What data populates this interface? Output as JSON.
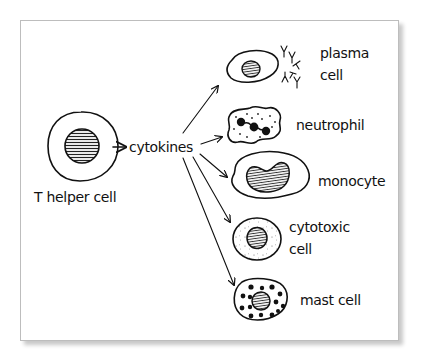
{
  "diagram": {
    "source": {
      "label": "T helper cell"
    },
    "mediator": {
      "label": "cytokines"
    },
    "targets": [
      {
        "label_line1": "plasma",
        "label_line2": "cell"
      },
      {
        "label_line1": "neutrophil",
        "label_line2": ""
      },
      {
        "label_line1": "monocyte",
        "label_line2": ""
      },
      {
        "label_line1": "cytotoxic",
        "label_line2": "cell"
      },
      {
        "label_line1": "mast cell",
        "label_line2": ""
      }
    ],
    "colors": {
      "ink": "#111111",
      "frame_border": "#bdbdbd",
      "background": "#ffffff"
    }
  }
}
